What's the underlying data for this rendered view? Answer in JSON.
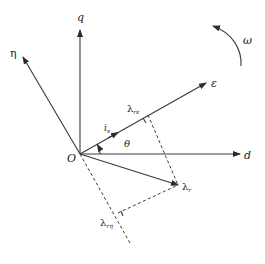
{
  "diagram": {
    "title": "",
    "type": "vector diagram of rotating reference frames",
    "origin_label": "O",
    "axes": [
      {
        "id": "q",
        "label": "q"
      },
      {
        "id": "d",
        "label": "d"
      },
      {
        "id": "eta",
        "label": "η"
      },
      {
        "id": "epsilon",
        "label": "ε"
      }
    ],
    "vectors": [
      {
        "id": "lambda_r",
        "label": "λ",
        "subscript": "r"
      }
    ],
    "projections": [
      {
        "id": "lambda_r_epsilon",
        "label": "λ",
        "subscript": "rε"
      },
      {
        "id": "lambda_r_eta",
        "label": "λ",
        "subscript": "rη"
      }
    ],
    "current_label": {
      "label": "i",
      "subscript": "s"
    },
    "angle_label": "θ",
    "rotation_label": "ω"
  }
}
